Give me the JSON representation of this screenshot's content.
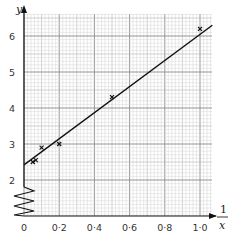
{
  "chart_data": {
    "type": "scatter",
    "title": "",
    "xlabel": "1/x",
    "ylabel": "y",
    "xlim": [
      0,
      1.07
    ],
    "ylim": [
      1.6,
      6.5
    ],
    "x_ticks": [
      "0",
      "0·2",
      "0·4",
      "0·6",
      "0·8",
      "1·0"
    ],
    "y_ticks": [
      "2",
      "3",
      "4",
      "5",
      "6"
    ],
    "grid": true,
    "y_axis_break": true,
    "legend": null,
    "series": [
      {
        "name": "data points",
        "marker": "x",
        "points": [
          {
            "x": 0.05,
            "y": 2.5
          },
          {
            "x": 0.067,
            "y": 2.55
          },
          {
            "x": 0.1,
            "y": 2.9
          },
          {
            "x": 0.2,
            "y": 3.0
          },
          {
            "x": 0.5,
            "y": 4.3
          },
          {
            "x": 1.0,
            "y": 6.2
          }
        ]
      },
      {
        "name": "line of best fit",
        "type": "line",
        "points": [
          {
            "x": 0,
            "y": 2.42
          },
          {
            "x": 1.07,
            "y": 6.3
          }
        ]
      }
    ]
  },
  "labels": {
    "x_axis_numerator": "1",
    "x_axis_denominator": "x",
    "y_axis": "y"
  }
}
